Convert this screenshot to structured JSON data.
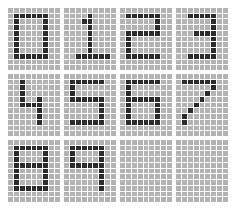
{
  "board": {
    "title": "Pixel Digit Grid",
    "description": "Bitmap font digit glyphs rendered on pixel grids",
    "columns": 4,
    "rows": 3,
    "panel_count": 12,
    "grid_width": 9,
    "grid_height": 11,
    "colors": {
      "background": "#ffffff",
      "cell_off": "#b3b3b3",
      "cell_on": "#2b2b2b",
      "gridline": "#ffffff"
    }
  },
  "panels": [
    {
      "index": 0,
      "label": "0",
      "name": "digit-zero",
      "empty": false,
      "pixels": [
        [
          0,
          0,
          0,
          0,
          0,
          0,
          0,
          0,
          0
        ],
        [
          0,
          1,
          1,
          1,
          1,
          1,
          1,
          0,
          0
        ],
        [
          0,
          1,
          0,
          0,
          0,
          0,
          1,
          0,
          0
        ],
        [
          0,
          1,
          0,
          0,
          0,
          0,
          1,
          0,
          0
        ],
        [
          0,
          1,
          0,
          0,
          0,
          0,
          1,
          0,
          0
        ],
        [
          0,
          1,
          0,
          0,
          0,
          0,
          1,
          0,
          0
        ],
        [
          0,
          1,
          0,
          0,
          0,
          0,
          1,
          0,
          0
        ],
        [
          0,
          1,
          0,
          0,
          0,
          0,
          1,
          0,
          0
        ],
        [
          0,
          1,
          1,
          1,
          1,
          1,
          1,
          0,
          0
        ],
        [
          0,
          0,
          0,
          0,
          0,
          0,
          0,
          0,
          0
        ],
        [
          0,
          0,
          0,
          0,
          0,
          0,
          0,
          0,
          0
        ]
      ]
    },
    {
      "index": 1,
      "label": "1",
      "name": "digit-one",
      "empty": false,
      "pixels": [
        [
          0,
          0,
          0,
          0,
          0,
          0,
          0,
          0,
          0
        ],
        [
          0,
          0,
          0,
          0,
          1,
          0,
          0,
          0,
          0
        ],
        [
          0,
          0,
          0,
          1,
          1,
          0,
          0,
          0,
          0
        ],
        [
          0,
          0,
          0,
          0,
          1,
          0,
          0,
          0,
          0
        ],
        [
          0,
          0,
          0,
          0,
          1,
          0,
          0,
          0,
          0
        ],
        [
          0,
          0,
          0,
          0,
          1,
          0,
          0,
          0,
          0
        ],
        [
          0,
          0,
          0,
          0,
          1,
          0,
          0,
          0,
          0
        ],
        [
          0,
          0,
          0,
          0,
          1,
          0,
          0,
          0,
          0
        ],
        [
          0,
          0,
          1,
          1,
          1,
          1,
          1,
          1,
          0
        ],
        [
          0,
          0,
          0,
          0,
          0,
          0,
          0,
          0,
          0
        ],
        [
          0,
          0,
          0,
          0,
          0,
          0,
          0,
          0,
          0
        ]
      ]
    },
    {
      "index": 2,
      "label": "2",
      "name": "digit-two",
      "empty": false,
      "pixels": [
        [
          0,
          0,
          0,
          0,
          0,
          0,
          0,
          0,
          0
        ],
        [
          0,
          1,
          1,
          1,
          1,
          1,
          1,
          0,
          0
        ],
        [
          0,
          0,
          0,
          0,
          0,
          0,
          1,
          0,
          0
        ],
        [
          0,
          0,
          0,
          0,
          0,
          0,
          1,
          0,
          0
        ],
        [
          0,
          1,
          1,
          1,
          1,
          1,
          1,
          0,
          0
        ],
        [
          0,
          1,
          0,
          0,
          0,
          0,
          0,
          0,
          0
        ],
        [
          0,
          1,
          0,
          0,
          0,
          0,
          0,
          0,
          0
        ],
        [
          0,
          1,
          0,
          0,
          0,
          0,
          0,
          0,
          0
        ],
        [
          0,
          1,
          1,
          1,
          1,
          1,
          1,
          0,
          0
        ],
        [
          0,
          0,
          0,
          0,
          0,
          0,
          0,
          0,
          0
        ],
        [
          0,
          0,
          0,
          0,
          0,
          0,
          0,
          0,
          0
        ]
      ]
    },
    {
      "index": 3,
      "label": "3",
      "name": "digit-three",
      "empty": false,
      "pixels": [
        [
          0,
          0,
          0,
          0,
          0,
          0,
          0,
          0,
          0
        ],
        [
          0,
          0,
          1,
          1,
          1,
          1,
          1,
          0,
          0
        ],
        [
          0,
          0,
          0,
          0,
          0,
          0,
          1,
          0,
          0
        ],
        [
          0,
          0,
          0,
          0,
          0,
          0,
          1,
          0,
          0
        ],
        [
          0,
          0,
          0,
          1,
          1,
          1,
          1,
          0,
          0
        ],
        [
          0,
          0,
          0,
          0,
          0,
          0,
          1,
          0,
          0
        ],
        [
          0,
          0,
          0,
          0,
          0,
          0,
          1,
          0,
          0
        ],
        [
          0,
          0,
          0,
          0,
          0,
          0,
          1,
          0,
          0
        ],
        [
          0,
          0,
          1,
          1,
          1,
          1,
          1,
          0,
          0
        ],
        [
          0,
          0,
          0,
          0,
          0,
          0,
          0,
          0,
          0
        ],
        [
          0,
          0,
          0,
          0,
          0,
          0,
          0,
          0,
          0
        ]
      ]
    },
    {
      "index": 4,
      "label": "4",
      "name": "digit-four",
      "empty": false,
      "pixels": [
        [
          0,
          0,
          0,
          0,
          0,
          0,
          0,
          0,
          0
        ],
        [
          0,
          0,
          1,
          0,
          0,
          0,
          0,
          0,
          0
        ],
        [
          0,
          0,
          1,
          0,
          0,
          0,
          0,
          0,
          0
        ],
        [
          0,
          0,
          1,
          0,
          0,
          0,
          0,
          0,
          0
        ],
        [
          0,
          0,
          1,
          0,
          0,
          1,
          0,
          0,
          0
        ],
        [
          0,
          0,
          1,
          1,
          1,
          1,
          0,
          0,
          0
        ],
        [
          0,
          0,
          0,
          0,
          0,
          1,
          0,
          0,
          0
        ],
        [
          0,
          0,
          0,
          0,
          0,
          1,
          0,
          0,
          0
        ],
        [
          0,
          0,
          0,
          0,
          0,
          1,
          0,
          0,
          0
        ],
        [
          0,
          0,
          0,
          0,
          0,
          0,
          0,
          0,
          0
        ],
        [
          0,
          0,
          0,
          0,
          0,
          0,
          0,
          0,
          0
        ]
      ]
    },
    {
      "index": 5,
      "label": "5",
      "name": "digit-five",
      "empty": false,
      "pixels": [
        [
          0,
          0,
          0,
          0,
          0,
          0,
          0,
          0,
          0
        ],
        [
          0,
          1,
          1,
          1,
          1,
          1,
          1,
          0,
          0
        ],
        [
          0,
          1,
          0,
          0,
          0,
          0,
          0,
          0,
          0
        ],
        [
          0,
          1,
          0,
          0,
          0,
          0,
          0,
          0,
          0
        ],
        [
          0,
          1,
          1,
          1,
          1,
          1,
          1,
          0,
          0
        ],
        [
          0,
          0,
          0,
          0,
          0,
          0,
          1,
          0,
          0
        ],
        [
          0,
          0,
          0,
          0,
          0,
          0,
          1,
          0,
          0
        ],
        [
          0,
          0,
          0,
          0,
          0,
          0,
          1,
          0,
          0
        ],
        [
          0,
          1,
          1,
          1,
          1,
          1,
          1,
          0,
          0
        ],
        [
          0,
          0,
          0,
          0,
          0,
          0,
          0,
          0,
          0
        ],
        [
          0,
          0,
          0,
          0,
          0,
          0,
          0,
          0,
          0
        ]
      ]
    },
    {
      "index": 6,
      "label": "6",
      "name": "digit-six",
      "empty": false,
      "pixels": [
        [
          0,
          0,
          0,
          0,
          0,
          0,
          0,
          0,
          0
        ],
        [
          0,
          1,
          1,
          1,
          1,
          1,
          1,
          0,
          0
        ],
        [
          0,
          1,
          0,
          0,
          0,
          0,
          0,
          0,
          0
        ],
        [
          0,
          1,
          0,
          0,
          0,
          0,
          0,
          0,
          0
        ],
        [
          0,
          1,
          1,
          1,
          1,
          1,
          1,
          0,
          0
        ],
        [
          0,
          1,
          0,
          0,
          0,
          0,
          1,
          0,
          0
        ],
        [
          0,
          1,
          0,
          0,
          0,
          0,
          1,
          0,
          0
        ],
        [
          0,
          1,
          0,
          0,
          0,
          0,
          1,
          0,
          0
        ],
        [
          0,
          1,
          1,
          1,
          1,
          1,
          1,
          0,
          0
        ],
        [
          0,
          0,
          0,
          0,
          0,
          0,
          0,
          0,
          0
        ],
        [
          0,
          0,
          0,
          0,
          0,
          0,
          0,
          0,
          0
        ]
      ]
    },
    {
      "index": 7,
      "label": "7",
      "name": "digit-seven",
      "empty": false,
      "pixels": [
        [
          0,
          0,
          0,
          0,
          0,
          0,
          0,
          0,
          0
        ],
        [
          0,
          1,
          1,
          1,
          1,
          1,
          1,
          0,
          0
        ],
        [
          0,
          0,
          0,
          0,
          0,
          0,
          1,
          0,
          0
        ],
        [
          0,
          0,
          0,
          0,
          0,
          1,
          0,
          0,
          0
        ],
        [
          0,
          0,
          0,
          0,
          1,
          0,
          0,
          0,
          0
        ],
        [
          0,
          0,
          0,
          1,
          0,
          0,
          0,
          0,
          0
        ],
        [
          0,
          0,
          1,
          0,
          0,
          0,
          0,
          0,
          0
        ],
        [
          0,
          1,
          0,
          0,
          0,
          0,
          0,
          0,
          0
        ],
        [
          0,
          1,
          0,
          0,
          0,
          0,
          0,
          0,
          0
        ],
        [
          0,
          0,
          0,
          0,
          0,
          0,
          0,
          0,
          0
        ],
        [
          0,
          0,
          0,
          0,
          0,
          0,
          0,
          0,
          0
        ]
      ]
    },
    {
      "index": 8,
      "label": "8",
      "name": "digit-eight",
      "empty": false,
      "pixels": [
        [
          0,
          0,
          0,
          0,
          0,
          0,
          0,
          0,
          0
        ],
        [
          0,
          1,
          1,
          1,
          1,
          1,
          1,
          0,
          0
        ],
        [
          0,
          1,
          0,
          0,
          0,
          0,
          1,
          0,
          0
        ],
        [
          0,
          1,
          0,
          0,
          0,
          0,
          1,
          0,
          0
        ],
        [
          0,
          1,
          1,
          1,
          1,
          1,
          1,
          0,
          0
        ],
        [
          0,
          1,
          0,
          0,
          0,
          0,
          1,
          0,
          0
        ],
        [
          0,
          1,
          0,
          0,
          0,
          0,
          1,
          0,
          0
        ],
        [
          0,
          1,
          0,
          0,
          0,
          0,
          1,
          0,
          0
        ],
        [
          0,
          1,
          1,
          1,
          1,
          1,
          1,
          0,
          0
        ],
        [
          0,
          0,
          0,
          0,
          0,
          0,
          0,
          0,
          0
        ],
        [
          0,
          0,
          0,
          0,
          0,
          0,
          0,
          0,
          0
        ]
      ]
    },
    {
      "index": 9,
      "label": "9",
      "name": "digit-nine",
      "empty": false,
      "pixels": [
        [
          0,
          0,
          0,
          0,
          0,
          0,
          0,
          0,
          0
        ],
        [
          0,
          1,
          1,
          1,
          1,
          1,
          1,
          0,
          0
        ],
        [
          0,
          1,
          0,
          0,
          0,
          0,
          1,
          0,
          0
        ],
        [
          0,
          1,
          0,
          0,
          0,
          0,
          1,
          0,
          0
        ],
        [
          0,
          1,
          1,
          1,
          1,
          1,
          1,
          0,
          0
        ],
        [
          0,
          0,
          0,
          0,
          0,
          0,
          1,
          0,
          0
        ],
        [
          0,
          0,
          0,
          0,
          0,
          0,
          1,
          0,
          0
        ],
        [
          0,
          0,
          0,
          0,
          0,
          0,
          1,
          0,
          0
        ],
        [
          0,
          0,
          0,
          0,
          0,
          0,
          1,
          0,
          0
        ],
        [
          0,
          0,
          0,
          0,
          0,
          0,
          0,
          0,
          0
        ],
        [
          0,
          0,
          0,
          0,
          0,
          0,
          0,
          0,
          0
        ]
      ]
    },
    {
      "index": 10,
      "label": "",
      "name": "empty-panel-1",
      "empty": true,
      "pixels": [
        [
          0,
          0,
          0,
          0,
          0,
          0,
          0,
          0,
          0
        ],
        [
          0,
          0,
          0,
          0,
          0,
          0,
          0,
          0,
          0
        ],
        [
          0,
          0,
          0,
          0,
          0,
          0,
          0,
          0,
          0
        ],
        [
          0,
          0,
          0,
          0,
          0,
          0,
          0,
          0,
          0
        ],
        [
          0,
          0,
          0,
          0,
          0,
          0,
          0,
          0,
          0
        ],
        [
          0,
          0,
          0,
          0,
          0,
          0,
          0,
          0,
          0
        ],
        [
          0,
          0,
          0,
          0,
          0,
          0,
          0,
          0,
          0
        ],
        [
          0,
          0,
          0,
          0,
          0,
          0,
          0,
          0,
          0
        ],
        [
          0,
          0,
          0,
          0,
          0,
          0,
          0,
          0,
          0
        ],
        [
          0,
          0,
          0,
          0,
          0,
          0,
          0,
          0,
          0
        ],
        [
          0,
          0,
          0,
          0,
          0,
          0,
          0,
          0,
          0
        ]
      ]
    },
    {
      "index": 11,
      "label": "",
      "name": "empty-panel-2",
      "empty": true,
      "pixels": [
        [
          0,
          0,
          0,
          0,
          0,
          0,
          0,
          0,
          0
        ],
        [
          0,
          0,
          0,
          0,
          0,
          0,
          0,
          0,
          0
        ],
        [
          0,
          0,
          0,
          0,
          0,
          0,
          0,
          0,
          0
        ],
        [
          0,
          0,
          0,
          0,
          0,
          0,
          0,
          0,
          0
        ],
        [
          0,
          0,
          0,
          0,
          0,
          0,
          0,
          0,
          0
        ],
        [
          0,
          0,
          0,
          0,
          0,
          0,
          0,
          0,
          0
        ],
        [
          0,
          0,
          0,
          0,
          0,
          0,
          0,
          0,
          0
        ],
        [
          0,
          0,
          0,
          0,
          0,
          0,
          0,
          0,
          0
        ],
        [
          0,
          0,
          0,
          0,
          0,
          0,
          0,
          0,
          0
        ],
        [
          0,
          0,
          0,
          0,
          0,
          0,
          0,
          0,
          0
        ],
        [
          0,
          0,
          0,
          0,
          0,
          0,
          0,
          0,
          0
        ]
      ]
    }
  ]
}
